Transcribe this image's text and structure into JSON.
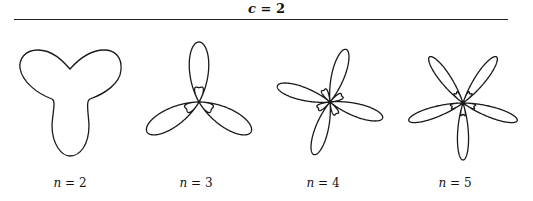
{
  "header": {
    "title_var": "c",
    "title_rest": " = 2"
  },
  "colors": {
    "stroke": "#1a1a1a",
    "rule": "#222222",
    "background": "#ffffff"
  },
  "panels": [
    {
      "label_var": "n",
      "label_rest": " = 2",
      "label_x": 70,
      "curve": {
        "type": "path",
        "d": "M70,69 C62,60 52,50 38,50 C24,50 19,60 20,68 C22,82 38,94 52,99 C56,101 53,110 52,125 C52,145 62,156 70,156 C80,156 89,145 89,125 C88,110 86,101 90,99 C104,94 120,84 121,70 C122,58 116,50 104,50 C90,50 78,60 70,69 Z"
      }
    },
    {
      "label_var": "n",
      "label_rest": " = 3",
      "label_x": 196,
      "curve": {
        "type": "rose",
        "k": 3,
        "a": 0.62,
        "b": 0.38,
        "cx": 199,
        "cy": 102,
        "scale": 60,
        "rotation_deg": 90,
        "squash": 1.0
      }
    },
    {
      "label_var": "n",
      "label_rest": " = 4",
      "label_x": 323,
      "curve": {
        "type": "rose",
        "k": 4,
        "a": 0.62,
        "b": 0.38,
        "cx": 330,
        "cy": 102,
        "scale": 55,
        "rotation_deg": -17,
        "squash": 1.0
      }
    },
    {
      "label_var": "n",
      "label_rest": " = 5",
      "label_x": 455,
      "curve": {
        "type": "rose",
        "k": 5,
        "a": 0.6,
        "b": 0.4,
        "cx": 463,
        "cy": 103,
        "scale": 57,
        "rotation_deg": -90,
        "squash": 1.0
      }
    }
  ]
}
